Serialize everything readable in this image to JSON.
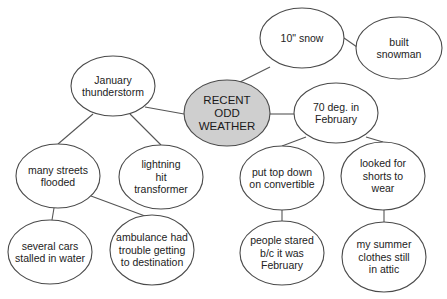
{
  "diagram": {
    "title": "RECENT ODD WEATHER",
    "center": {
      "id": "center",
      "label": "RECENT\nODD\nWEATHER",
      "cx": 227,
      "cy": 113,
      "rx": 43,
      "ry": 33,
      "fill": "#cfcfcf"
    },
    "nodes": [
      {
        "id": "january-thunderstorm",
        "label": "January\nthunderstorm",
        "cx": 113,
        "cy": 86,
        "rx": 42,
        "ry": 30
      },
      {
        "id": "ten-inch-snow",
        "label": "10\" snow",
        "cx": 302,
        "cy": 38,
        "rx": 42,
        "ry": 30
      },
      {
        "id": "built-snowman",
        "label": "built\nsnowman",
        "cx": 399,
        "cy": 48,
        "rx": 43,
        "ry": 31
      },
      {
        "id": "seventy-deg-february",
        "label": "70 deg. in\nFebruary",
        "cx": 336,
        "cy": 113,
        "rx": 42,
        "ry": 30
      },
      {
        "id": "many-streets-flooded",
        "label": "many streets\nflooded",
        "cx": 58,
        "cy": 176,
        "rx": 42,
        "ry": 32
      },
      {
        "id": "lightning-hit-transformer",
        "label": "lightning\nhit\ntransformer",
        "cx": 161,
        "cy": 177,
        "rx": 42,
        "ry": 32
      },
      {
        "id": "put-top-down",
        "label": "put top down\non convertible",
        "cx": 282,
        "cy": 178,
        "rx": 42,
        "ry": 32
      },
      {
        "id": "looked-for-shorts",
        "label": "looked for\nshorts to\nwear",
        "cx": 383,
        "cy": 176,
        "rx": 42,
        "ry": 34
      },
      {
        "id": "several-cars-stalled",
        "label": "several cars\nstalled in water",
        "cx": 50,
        "cy": 252,
        "rx": 42,
        "ry": 32
      },
      {
        "id": "ambulance-trouble",
        "label": "ambulance had\ntrouble getting\nto destination",
        "cx": 152,
        "cy": 250,
        "rx": 42,
        "ry": 35
      },
      {
        "id": "people-stared",
        "label": "people stared\nb/c it was\nFebruary",
        "cx": 282,
        "cy": 253,
        "rx": 42,
        "ry": 32
      },
      {
        "id": "summer-clothes-attic",
        "label": "my summer\nclothes still\nin attic",
        "cx": 384,
        "cy": 257,
        "rx": 42,
        "ry": 35
      }
    ],
    "edges": [
      {
        "from": "center",
        "to": "january-thunderstorm",
        "x1": 184,
        "y1": 114,
        "x2": 145,
        "y2": 107
      },
      {
        "from": "center",
        "to": "ten-inch-snow",
        "x1": 240,
        "y1": 82,
        "x2": 270,
        "y2": 67
      },
      {
        "from": "center",
        "to": "seventy-deg-february",
        "x1": 270,
        "y1": 114,
        "x2": 294,
        "y2": 114
      },
      {
        "from": "ten-inch-snow",
        "to": "built-snowman",
        "x1": 344,
        "y1": 38,
        "x2": 357,
        "y2": 47
      },
      {
        "from": "january-thunderstorm",
        "to": "many-streets-flooded",
        "x1": 93,
        "y1": 114,
        "x2": 58,
        "y2": 144
      },
      {
        "from": "january-thunderstorm",
        "to": "lightning-hit-transformer",
        "x1": 130,
        "y1": 114,
        "x2": 161,
        "y2": 145
      },
      {
        "from": "seventy-deg-february",
        "to": "put-top-down",
        "x1": 306,
        "y1": 137,
        "x2": 282,
        "y2": 146
      },
      {
        "from": "seventy-deg-february",
        "to": "looked-for-shorts",
        "x1": 366,
        "y1": 137,
        "x2": 383,
        "y2": 142
      },
      {
        "from": "many-streets-flooded",
        "to": "several-cars-stalled",
        "x1": 54,
        "y1": 208,
        "x2": 52,
        "y2": 220
      },
      {
        "from": "many-streets-flooded",
        "to": "ambulance-trouble",
        "x1": 91,
        "y1": 196,
        "x2": 145,
        "y2": 216
      },
      {
        "from": "put-top-down",
        "to": "people-stared",
        "x1": 282,
        "y1": 210,
        "x2": 282,
        "y2": 221
      },
      {
        "from": "looked-for-shorts",
        "to": "summer-clothes-attic",
        "x1": 384,
        "y1": 210,
        "x2": 384,
        "y2": 222
      }
    ]
  }
}
